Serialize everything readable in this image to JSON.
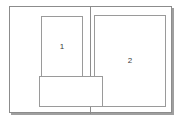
{
  "diagram": {
    "type": "page-spread-layout",
    "title": "",
    "frame": {
      "name": "spread-frame",
      "border_color": "#8c8c8c",
      "fill_color": "#ffffff",
      "shadow_color": "#505050",
      "x": 9,
      "y": 6,
      "width": 163,
      "height": 107
    },
    "gutter": {
      "name": "gutter-line",
      "color": "#8c8c8c",
      "x": 89,
      "y": 6,
      "height": 107
    },
    "boxes": [
      {
        "id": "box-1",
        "label": "1",
        "page": "left",
        "orientation": "portrait",
        "x": 40,
        "y": 15,
        "width": 42,
        "height": 62,
        "border_color": "#9a9a9a",
        "fill_color": "#ffffff"
      },
      {
        "id": "box-2",
        "label": "2",
        "page": "right",
        "orientation": "portrait",
        "x": 93,
        "y": 14,
        "width": 72,
        "height": 92,
        "border_color": "#9a9a9a",
        "fill_color": "#ffffff"
      },
      {
        "id": "box-3",
        "label": "",
        "page": "left",
        "orientation": "landscape",
        "x": 38,
        "y": 75,
        "width": 64,
        "height": 31,
        "border_color": "#9a9a9a",
        "fill_color": "#ffffff"
      }
    ],
    "background_color": "#ffffff",
    "text_color": "#3b3b3b"
  }
}
